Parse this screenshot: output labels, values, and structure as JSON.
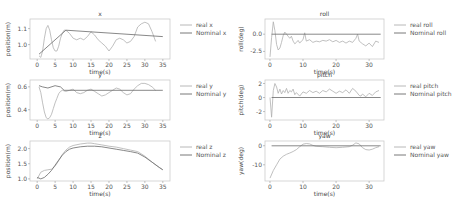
{
  "colors": {
    "real": "#b0b0b0",
    "nominal": "#6a6a6a",
    "frame": "#cccccc"
  },
  "chart_data": [
    {
      "id": "x",
      "type": "line",
      "title": "x",
      "xlabel": "time(s)",
      "ylabel": "position(m)",
      "frame": {
        "left": 30,
        "top": 19,
        "right": 170,
        "bottom": 59
      },
      "xlim": [
        -2,
        37
      ],
      "ylim": [
        0.91,
        1.16
      ],
      "xticks": [
        0,
        5,
        10,
        15,
        20,
        25,
        30,
        35
      ],
      "yticks": [
        1.0,
        1.1
      ],
      "series": [
        {
          "name": "real x",
          "role": "real",
          "x": [
            0.5,
            1,
            1.5,
            2,
            2.5,
            3,
            3.5,
            4,
            4.5,
            5,
            5.5,
            6,
            6.5,
            7,
            7.5,
            8,
            9,
            10,
            11,
            12,
            13,
            14,
            15,
            16,
            17,
            18,
            19,
            20,
            21,
            22,
            23,
            24,
            25,
            26,
            27,
            28,
            29,
            30,
            31,
            32,
            33
          ],
          "y": [
            0.93,
            0.92,
            0.96,
            1.04,
            1.1,
            1.12,
            1.09,
            1.03,
            0.98,
            0.96,
            0.96,
            0.99,
            1.04,
            1.07,
            1.09,
            1.09,
            1.07,
            1.04,
            1.03,
            1.04,
            1.03,
            1.05,
            1.08,
            1.06,
            1.03,
            1.01,
            0.99,
            0.96,
            0.99,
            1.03,
            1.04,
            1.03,
            1.01,
            1.02,
            1.05,
            1.11,
            1.13,
            1.14,
            1.13,
            1.08,
            1.02
          ]
        },
        {
          "name": "Nominal x",
          "role": "nominal",
          "x": [
            0.5,
            8,
            35
          ],
          "y": [
            0.94,
            1.09,
            1.05
          ]
        }
      ]
    },
    {
      "id": "y",
      "type": "line",
      "title": "y",
      "xlabel": "time(s)",
      "ylabel": "position(m)",
      "frame": {
        "left": 30,
        "top": 80,
        "right": 170,
        "bottom": 120
      },
      "xlim": [
        -2,
        37
      ],
      "ylim": [
        0.31,
        0.66
      ],
      "xticks": [
        0,
        5,
        10,
        15,
        20,
        25,
        30,
        35
      ],
      "yticks": [
        0.4,
        0.6
      ],
      "series": [
        {
          "name": "real y",
          "role": "real",
          "x": [
            0.5,
            1,
            1.5,
            2,
            2.5,
            3,
            3.5,
            4,
            4.5,
            5,
            5.5,
            6,
            6.5,
            7,
            8,
            9,
            10,
            11,
            12,
            13,
            14,
            15,
            16,
            17,
            18,
            19,
            20,
            21,
            22,
            23,
            24,
            25,
            26,
            27,
            28,
            29,
            30,
            31,
            32,
            33
          ],
          "y": [
            0.6,
            0.55,
            0.46,
            0.38,
            0.33,
            0.32,
            0.33,
            0.36,
            0.41,
            0.46,
            0.5,
            0.54,
            0.56,
            0.57,
            0.56,
            0.57,
            0.58,
            0.55,
            0.54,
            0.55,
            0.57,
            0.58,
            0.56,
            0.54,
            0.52,
            0.53,
            0.55,
            0.57,
            0.59,
            0.58,
            0.55,
            0.53,
            0.54,
            0.58,
            0.61,
            0.63,
            0.63,
            0.62,
            0.6,
            0.57
          ]
        },
        {
          "name": "Nominal y",
          "role": "nominal",
          "x": [
            0.5,
            1.5,
            3,
            5,
            6.5,
            7.5,
            35
          ],
          "y": [
            0.61,
            0.6,
            0.59,
            0.61,
            0.6,
            0.57,
            0.57
          ]
        }
      ]
    },
    {
      "id": "z",
      "type": "line",
      "title": "z",
      "xlabel": "time(s)",
      "ylabel": "position(m)",
      "frame": {
        "left": 30,
        "top": 141,
        "right": 170,
        "bottom": 181
      },
      "xlim": [
        -2,
        37
      ],
      "ylim": [
        0.93,
        2.25
      ],
      "xticks": [
        0,
        5,
        10,
        15,
        20,
        25,
        30,
        35
      ],
      "yticks": [
        1.0,
        1.5,
        2.0
      ],
      "series": [
        {
          "name": "real z",
          "role": "real",
          "x": [
            0,
            1,
            2,
            3,
            4,
            5,
            6,
            7,
            8,
            9,
            10,
            12,
            14,
            15,
            16,
            18,
            20,
            22,
            24,
            26,
            28,
            30,
            32,
            34,
            35
          ],
          "y": [
            1.0,
            1.22,
            1.28,
            1.3,
            1.32,
            1.42,
            1.6,
            1.8,
            1.95,
            2.05,
            2.1,
            2.15,
            2.18,
            2.18,
            2.16,
            2.12,
            2.08,
            2.05,
            2.0,
            1.95,
            1.9,
            1.75,
            1.55,
            1.38,
            1.3
          ]
        },
        {
          "name": "Nominal z",
          "role": "nominal",
          "x": [
            0,
            1,
            2,
            3,
            4,
            5,
            6,
            7,
            8,
            9,
            10,
            12,
            14,
            16,
            18,
            20,
            22,
            24,
            26,
            28,
            30,
            32,
            34,
            35
          ],
          "y": [
            1.05,
            1.0,
            1.05,
            1.15,
            1.28,
            1.45,
            1.62,
            1.78,
            1.9,
            1.98,
            2.02,
            2.06,
            2.08,
            2.08,
            2.06,
            2.02,
            1.98,
            1.94,
            1.9,
            1.85,
            1.72,
            1.55,
            1.38,
            1.3
          ]
        }
      ]
    },
    {
      "id": "roll",
      "type": "line",
      "title": "roll",
      "xlabel": "time(s)",
      "ylabel": "roll(deg)",
      "frame": {
        "left": 265,
        "top": 19,
        "right": 384,
        "bottom": 59
      },
      "xlim": [
        -1.5,
        34.5
      ],
      "ylim": [
        -3.6,
        2.2
      ],
      "xticks": [
        0,
        10,
        20,
        30
      ],
      "yticks": [
        -2.5,
        0.0
      ],
      "series": [
        {
          "name": "real roll",
          "role": "real",
          "x": [
            0,
            0.5,
            1,
            1.5,
            2,
            2.5,
            3,
            3.5,
            4,
            4.5,
            5,
            5.5,
            6,
            6.5,
            7,
            7.5,
            8,
            8.5,
            9,
            9.5,
            10,
            10.5,
            11,
            12,
            13,
            14,
            15,
            16,
            17,
            18,
            19,
            20,
            21,
            22,
            23,
            24,
            25,
            26,
            26.5,
            27,
            28,
            29,
            30,
            31,
            32,
            33
          ],
          "y": [
            -3.3,
            -0.5,
            1.8,
            0.5,
            -1.5,
            -2.3,
            -2.0,
            -1.2,
            -0.2,
            0.3,
            0.0,
            -0.3,
            -0.6,
            -0.3,
            -1.0,
            -1.4,
            -1.2,
            -0.9,
            -1.3,
            -1.0,
            -0.8,
            0.2,
            -1.0,
            -0.8,
            -1.2,
            -1.0,
            -1.1,
            -0.9,
            -1.0,
            -0.8,
            -1.1,
            -0.9,
            -1.2,
            -1.0,
            -1.3,
            -1.0,
            -1.2,
            -0.6,
            0.0,
            -1.0,
            -1.4,
            -1.7,
            -1.3,
            -1.8,
            -1.0,
            -1.2
          ]
        },
        {
          "name": "Nominal roll",
          "role": "nominal",
          "x": [
            0.5,
            33.5
          ],
          "y": [
            0.0,
            0.0
          ]
        }
      ]
    },
    {
      "id": "pitch",
      "type": "line",
      "title": "pitch",
      "xlabel": "time(s)",
      "ylabel": "pitch(deg)",
      "frame": {
        "left": 265,
        "top": 80,
        "right": 384,
        "bottom": 120
      },
      "xlim": [
        -1.5,
        34.5
      ],
      "ylim": [
        -3.2,
        2.5
      ],
      "xticks": [
        0,
        10,
        20,
        30
      ],
      "yticks": [
        -2,
        0,
        2
      ],
      "series": [
        {
          "name": "real pitch",
          "role": "real",
          "x": [
            0,
            0.5,
            1,
            1.5,
            2,
            2.5,
            3,
            3.5,
            4,
            4.5,
            5,
            5.5,
            6,
            6.5,
            7,
            7.5,
            8,
            9,
            10,
            11,
            12,
            13,
            14,
            15,
            16,
            17,
            18,
            19,
            20,
            21,
            22,
            23,
            24,
            25,
            26,
            27,
            27.5,
            28,
            29,
            30,
            31,
            32,
            33
          ],
          "y": [
            0,
            -2.8,
            1.0,
            2.0,
            1.5,
            0.6,
            1.2,
            0.5,
            1.0,
            0.7,
            1.3,
            0.6,
            1.0,
            0.8,
            1.2,
            0.4,
            0.7,
            0.2,
            0.8,
            0.6,
            1.0,
            0.7,
            0.9,
            0.6,
            1.0,
            0.8,
            1.2,
            0.9,
            0.6,
            0.9,
            0.7,
            1.1,
            0.6,
            1.3,
            0.9,
            0.3,
            0.2,
            0.5,
            0.1,
            0.6,
            0.3,
            0.8,
            1.0
          ]
        },
        {
          "name": "Nominal pitch",
          "role": "nominal",
          "x": [
            0.5,
            33.5
          ],
          "y": [
            0.0,
            0.0
          ]
        }
      ]
    },
    {
      "id": "yaw",
      "type": "line",
      "title": "yaw",
      "xlabel": "time(s)",
      "ylabel": "yaw(deg)",
      "frame": {
        "left": 265,
        "top": 141,
        "right": 384,
        "bottom": 181
      },
      "xlim": [
        -1.5,
        34.5
      ],
      "ylim": [
        -18.5,
        2.5
      ],
      "xticks": [
        0,
        10,
        20,
        30
      ],
      "yticks": [
        -10,
        0
      ],
      "series": [
        {
          "name": "real yaw",
          "role": "real",
          "x": [
            0,
            1,
            2,
            3,
            4,
            5,
            6,
            7,
            8,
            9,
            10,
            11,
            12,
            13,
            14,
            16,
            18,
            20,
            22,
            24,
            25,
            26,
            27,
            28,
            29,
            30,
            31,
            32,
            33
          ],
          "y": [
            -17,
            -13,
            -10,
            -7,
            -5.5,
            -4.5,
            -3.8,
            -3,
            -2,
            -0.5,
            0.8,
            1.2,
            1.0,
            0.2,
            -0.3,
            -0.5,
            -0.8,
            -1.0,
            -0.8,
            -0.5,
            0.3,
            1.5,
            1.0,
            -1.0,
            -2.0,
            -2.2,
            -1.8,
            -1.0,
            -0.5
          ]
        },
        {
          "name": "Nominal yaw",
          "role": "nominal",
          "x": [
            0.5,
            33.5
          ],
          "y": [
            0.0,
            0.0
          ]
        }
      ]
    }
  ],
  "legends": [
    {
      "chart": "x",
      "items": [
        "real x",
        "Nominal x"
      ]
    },
    {
      "chart": "y",
      "items": [
        "real y",
        "Nominal y"
      ]
    },
    {
      "chart": "z",
      "items": [
        "real z",
        "Nominal z"
      ]
    },
    {
      "chart": "roll",
      "items": [
        "real roll",
        "Nominal roll"
      ]
    },
    {
      "chart": "pitch",
      "items": [
        "real pitch",
        "Nominal pitch"
      ]
    },
    {
      "chart": "yaw",
      "items": [
        "real yaw",
        "Nominal yaw"
      ]
    }
  ]
}
